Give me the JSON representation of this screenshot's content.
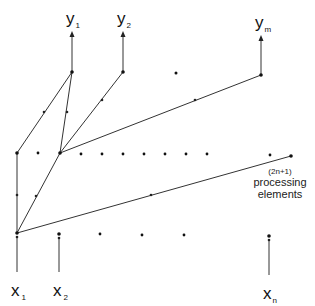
{
  "diagram": {
    "type": "network-architecture",
    "colors": {
      "line": "#333333",
      "node": "#111111",
      "text": "#111111",
      "background": "#ffffff"
    },
    "outputs": [
      {
        "base": "y",
        "sub": "1",
        "x": 72
      },
      {
        "base": "y",
        "sub": "2",
        "x": 123
      },
      {
        "base": "y",
        "sub": "m",
        "x": 261
      }
    ],
    "inputs": [
      {
        "base": "x",
        "sub": "1",
        "x": 17
      },
      {
        "base": "x",
        "sub": "2",
        "x": 59
      },
      {
        "base": "x",
        "sub": "n",
        "x": 269
      }
    ],
    "annotation": {
      "line1": "(2n+1)",
      "line2": "processing",
      "line3": "elements"
    }
  }
}
